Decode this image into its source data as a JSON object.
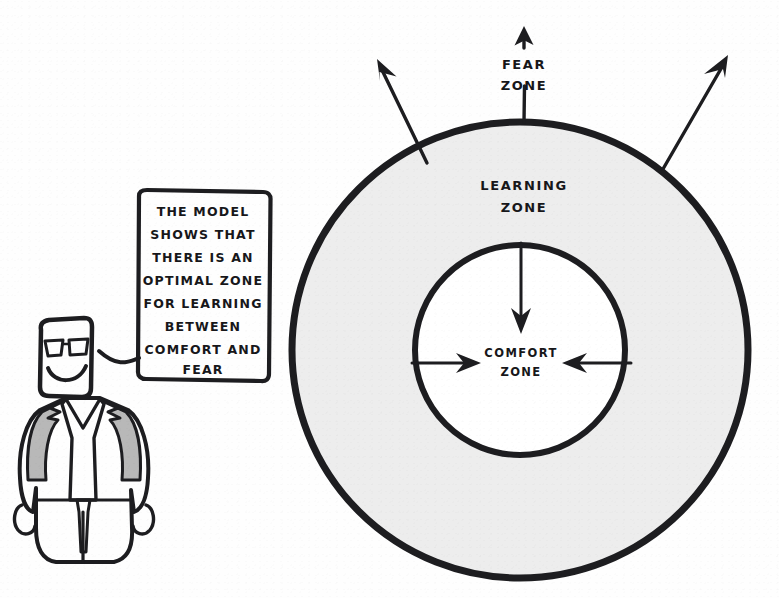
{
  "page": {
    "style": "hand-drawn sketch, black ink on white paper"
  },
  "colors": {
    "ink": "#1d1d20",
    "paper": "#fefefe",
    "ring_fill": "#ededed",
    "inner_fill": "#ffffff",
    "suit_shade": "#b8b8b8",
    "suit_light": "#d8d8d8"
  },
  "diagram": {
    "type": "concentric-zones",
    "center": {
      "x": 520,
      "y": 350
    },
    "outer_radius": 228,
    "inner_radius": 105,
    "zones": [
      {
        "id": "fear",
        "label_lines": [
          "FEAR",
          "ZONE"
        ],
        "label_x": 524,
        "label_y": 68,
        "region": "outside the outer circle"
      },
      {
        "id": "learning",
        "label_lines": [
          "LEARNING",
          "ZONE"
        ],
        "label_x": 524,
        "label_y": 189,
        "region": "gray annulus between inner and outer circle"
      },
      {
        "id": "comfort",
        "label_lines": [
          "COMFORT",
          "ZONE"
        ],
        "label_x": 521,
        "label_y": 356,
        "region": "white inner circle"
      }
    ],
    "arrows": [
      {
        "id": "fear-arrow-up",
        "direction": "up",
        "label": "outward to fear zone"
      },
      {
        "id": "fear-arrow-up-left",
        "direction": "up-left",
        "label": "outward to fear zone"
      },
      {
        "id": "fear-arrow-up-right",
        "direction": "up-right",
        "label": "outward to fear zone"
      },
      {
        "id": "comfort-arrow-down",
        "direction": "down",
        "label": "inward to comfort zone"
      },
      {
        "id": "comfort-arrow-right",
        "direction": "right",
        "label": "inward to comfort zone"
      },
      {
        "id": "comfort-arrow-left",
        "direction": "left",
        "label": "inward to comfort zone"
      }
    ]
  },
  "speech_bubble": {
    "lines": [
      "THE MODEL",
      "SHOWS THAT",
      "THERE IS AN",
      "OPTIMAL ZONE",
      "FOR LEARNING",
      "BETWEEN",
      "COMFORT AND",
      "FEAR"
    ],
    "box": {
      "x": 133,
      "y": 191,
      "width": 139,
      "height": 191
    },
    "tail": "lower-left, pointing toward the character's head"
  },
  "character": {
    "id": "presenter",
    "description": "cartoon man in a suit with sunglasses and a wide smile",
    "features": [
      "rectangular-head",
      "sunglasses",
      "smile",
      "suit-jacket",
      "necktie",
      "arms-at-sides"
    ]
  }
}
